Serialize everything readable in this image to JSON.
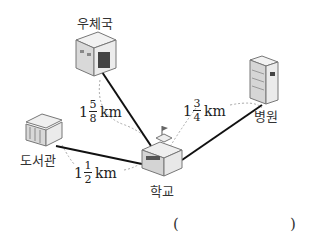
{
  "places": {
    "post_office": "우체국",
    "hospital": "병원",
    "library": "도서관",
    "school": "학교"
  },
  "distances": {
    "post_office_school": {
      "whole": "1",
      "num": "5",
      "den": "8",
      "unit": "km"
    },
    "hospital_school": {
      "whole": "1",
      "num": "3",
      "den": "4",
      "unit": "km"
    },
    "library_school": {
      "whole": "1",
      "num": "1",
      "den": "2",
      "unit": "km"
    }
  },
  "answer": {
    "open_paren": "(",
    "close_paren": ")"
  },
  "colors": {
    "line": "#111111",
    "dashed_arc": "#999999",
    "building_fill": "#e4e4e4",
    "building_stroke": "#777777"
  }
}
